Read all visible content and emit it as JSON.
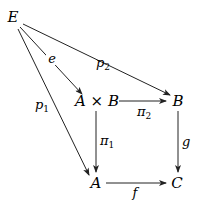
{
  "diagram": {
    "type": "commutative-diagram",
    "nodes": [
      {
        "id": "E",
        "label": "E",
        "x": 13,
        "y": 22
      },
      {
        "id": "AxB",
        "label": "A × B",
        "x": 97,
        "y": 106
      },
      {
        "id": "B",
        "label": "B",
        "x": 178,
        "y": 106
      },
      {
        "id": "A",
        "label": "A",
        "x": 96,
        "y": 188
      },
      {
        "id": "C",
        "label": "C",
        "x": 177,
        "y": 188
      }
    ],
    "edges": [
      {
        "from": "E",
        "to": "AxB",
        "label": "e"
      },
      {
        "from": "E",
        "to": "B",
        "label": "p",
        "sub": "2"
      },
      {
        "from": "E",
        "to": "A",
        "label": "p",
        "sub": "1"
      },
      {
        "from": "AxB",
        "to": "B",
        "label": "π",
        "sub": "2"
      },
      {
        "from": "AxB",
        "to": "A",
        "label": "π",
        "sub": "1"
      },
      {
        "from": "B",
        "to": "C",
        "label": "g"
      },
      {
        "from": "A",
        "to": "C",
        "label": "f"
      }
    ]
  }
}
